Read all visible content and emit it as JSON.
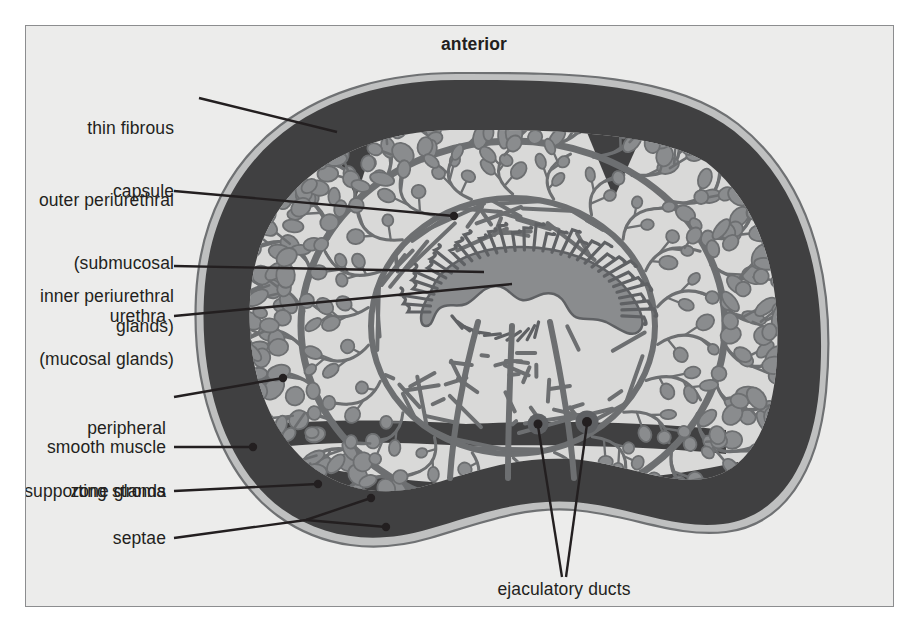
{
  "figure": {
    "title_label": "anterior",
    "background_color": "#ececeb",
    "frame_border_color": "#8c8d8f",
    "ink_color": "#231f20"
  },
  "palette": {
    "capsule_outline": "#6f7173",
    "smooth_muscle": "#404041",
    "stroma_light": "#d9d9d8",
    "gland_fill": "#8a8c8e",
    "duct_line": "#6d6f71",
    "urethra_lumen": "#8a8c8e",
    "leader_line": "#231f20"
  },
  "labels": [
    {
      "id": "anterior",
      "text": "anterior",
      "align": "center",
      "bold": true
    },
    {
      "id": "thin-fibrous-capsule",
      "line1": "thin fibrous",
      "line2": "capsule",
      "align": "right"
    },
    {
      "id": "outer-periurethral",
      "line1": "outer periurethral",
      "line2": "(submucosal",
      "line3": "glands)",
      "align": "right"
    },
    {
      "id": "inner-periurethral",
      "line1": "inner periurethral",
      "line2": "(mucosal glands)",
      "align": "right"
    },
    {
      "id": "urethra",
      "text": "urethra",
      "align": "right"
    },
    {
      "id": "peripheral-zone",
      "line1": "peripheral",
      "line2": "zone glands",
      "align": "right"
    },
    {
      "id": "smooth-muscle",
      "text": "smooth muscle",
      "align": "right"
    },
    {
      "id": "supporting-stroma",
      "text": "supporting stroma",
      "align": "right"
    },
    {
      "id": "septae",
      "text": "septae",
      "align": "right"
    },
    {
      "id": "ejaculatory-ducts",
      "text": "ejaculatory ducts",
      "align": "center"
    }
  ],
  "label_text": {
    "anterior": "anterior",
    "thin_fibrous_capsule_l1": "thin fibrous",
    "thin_fibrous_capsule_l2": "capsule",
    "outer_periurethral_l1": "outer periurethral",
    "outer_periurethral_l2": "(submucosal",
    "outer_periurethral_l3": "glands)",
    "inner_periurethral_l1": "inner periurethral",
    "inner_periurethral_l2": "(mucosal glands)",
    "urethra": "urethra",
    "peripheral_zone_l1": "peripheral",
    "peripheral_zone_l2": "zone glands",
    "smooth_muscle": "smooth muscle",
    "supporting_stroma": "supporting stroma",
    "septae": "septae",
    "ejaculatory_ducts": "ejaculatory ducts"
  },
  "anatomy": {
    "regions": [
      {
        "name": "thin fibrous capsule",
        "description": "outermost thin pale outline ring enclosing the gland"
      },
      {
        "name": "smooth muscle",
        "description": "broad dark band beneath the capsule"
      },
      {
        "name": "peripheral zone glands",
        "description": "outer field of acini with branching ducts"
      },
      {
        "name": "outer periurethral (submucosal glands)",
        "description": "intermediate concentric zone of glands"
      },
      {
        "name": "inner periurethral (mucosal glands)",
        "description": "short glands clustered immediately around the urethra"
      },
      {
        "name": "urethra",
        "description": "central crescent-shaped lumen"
      },
      {
        "name": "ejaculatory ducts",
        "description": "paired round duct profiles below the urethra"
      },
      {
        "name": "supporting stroma",
        "description": "pale connective tissue matrix between acini"
      },
      {
        "name": "septae",
        "description": "fibrous partitions extending inward from the capsule"
      }
    ]
  }
}
